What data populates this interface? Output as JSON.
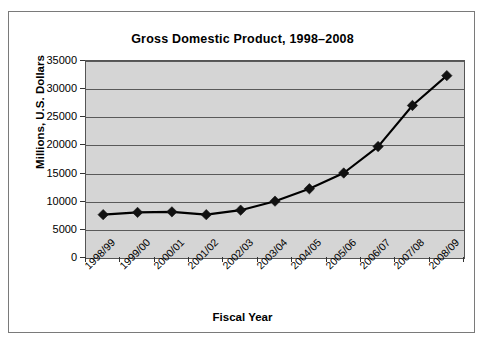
{
  "chart_data": {
    "type": "line",
    "title": "Gross Domestic Product, 1998–2008",
    "xlabel": "Fiscal Year",
    "ylabel": "Millions, U.S. Dollars",
    "categories": [
      "1998/99",
      "1999/00",
      "2000/01",
      "2001/02",
      "2002/03",
      "2003/04",
      "2004/05",
      "2005/06",
      "2006/07",
      "2007/08",
      "2008/09"
    ],
    "values": [
      7700,
      8100,
      8200,
      7700,
      8500,
      10100,
      12300,
      15100,
      19800,
      27100,
      32400
    ],
    "series": [
      {
        "name": "Gross Domestic Product",
        "values": [
          7700,
          8100,
          8200,
          7700,
          8500,
          10100,
          12300,
          15100,
          19800,
          27100,
          32400
        ]
      }
    ],
    "ylim": [
      0,
      35000
    ],
    "yticks": [
      0,
      5000,
      10000,
      15000,
      20000,
      25000,
      30000,
      35000
    ],
    "ytick_labels": [
      "0",
      "5000",
      "10000",
      "15000",
      "20000",
      "25000",
      "30000",
      "35000"
    ],
    "grid": true,
    "legend": "none",
    "marker": "diamond",
    "line_color": "#000000",
    "marker_color": "#111111",
    "plot_background": "#d5d5d5",
    "figure_background": "#ffffff",
    "border_color": "#7a7a7a"
  }
}
